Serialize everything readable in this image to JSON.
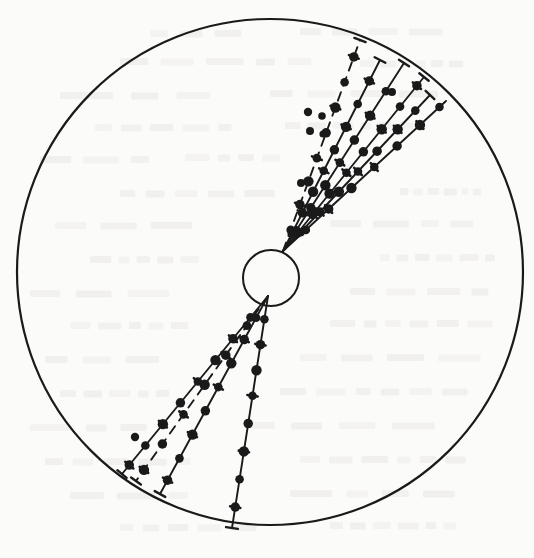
{
  "figure": {
    "kind": "track-chamber-event-display",
    "caption": "",
    "background_color": "#fbfbfa",
    "ink_color": "#1a1a1a",
    "ghost_text_color": "#c9c7c2"
  },
  "detector_boundary": {
    "label": "outer detector circle",
    "center_x": 270,
    "center_y": 272,
    "radius": 253,
    "stroke_width": 2.2
  },
  "vertex_circle": {
    "label": "interaction vertex circle",
    "center_x": 271,
    "center_y": 278,
    "radius": 28,
    "stroke_width": 2.0
  },
  "vertex": {
    "label": "primary vertex",
    "x": 278,
    "y": 258
  },
  "chart_data": {
    "type": "scatter",
    "title": "",
    "xlabel": "",
    "ylabel": "",
    "xlim": [
      17,
      523
    ],
    "ylim": [
      19,
      525
    ],
    "grid": false,
    "legend": "none",
    "tracks": [
      {
        "name": "upper-track-1",
        "style": "dashed",
        "x1": 283,
        "y1": 251,
        "x2": 360,
        "y2": 40,
        "points_t": [
          0.1,
          0.22,
          0.33,
          0.44,
          0.56,
          0.68,
          0.8,
          0.92
        ],
        "end_tick": true
      },
      {
        "name": "upper-track-2",
        "style": "solid",
        "x1": 283,
        "y1": 251,
        "x2": 380,
        "y2": 60,
        "points_t": [
          0.09,
          0.2,
          0.31,
          0.42,
          0.53,
          0.65,
          0.77,
          0.89
        ],
        "end_tick": true
      },
      {
        "name": "upper-track-3",
        "style": "solid",
        "x1": 283,
        "y1": 251,
        "x2": 404,
        "y2": 63,
        "points_t": [
          0.11,
          0.23,
          0.35,
          0.47,
          0.59,
          0.72,
          0.85
        ],
        "end_tick": true
      },
      {
        "name": "upper-track-4",
        "style": "solid",
        "x1": 283,
        "y1": 251,
        "x2": 424,
        "y2": 77,
        "points_t": [
          0.1,
          0.21,
          0.33,
          0.45,
          0.57,
          0.7,
          0.83,
          0.95
        ],
        "end_tick": true
      },
      {
        "name": "upper-track-5",
        "style": "solid",
        "x1": 283,
        "y1": 251,
        "x2": 430,
        "y2": 95,
        "points_t": [
          0.12,
          0.25,
          0.38,
          0.51,
          0.64,
          0.78,
          0.9
        ],
        "end_tick": true
      },
      {
        "name": "upper-track-6",
        "style": "solid",
        "x1": 283,
        "y1": 251,
        "x2": 446,
        "y2": 101,
        "points_t": [
          0.14,
          0.28,
          0.42,
          0.56,
          0.7,
          0.84,
          0.96
        ],
        "end_tick": false
      },
      {
        "name": "lower-track-1",
        "style": "solid",
        "x1": 268,
        "y1": 296,
        "x2": 122,
        "y2": 474,
        "points_t": [
          0.12,
          0.24,
          0.36,
          0.48,
          0.6,
          0.72,
          0.84,
          0.95
        ],
        "end_tick": true
      },
      {
        "name": "lower-track-2",
        "style": "dashed",
        "x1": 268,
        "y1": 296,
        "x2": 136,
        "y2": 481,
        "points_t": [
          0.16,
          0.32,
          0.48,
          0.64,
          0.8,
          0.94
        ],
        "end_tick": true
      },
      {
        "name": "lower-track-3",
        "style": "solid",
        "x1": 268,
        "y1": 296,
        "x2": 160,
        "y2": 494,
        "points_t": [
          0.11,
          0.22,
          0.34,
          0.46,
          0.58,
          0.7,
          0.82,
          0.93
        ],
        "end_tick": true
      },
      {
        "name": "lower-track-4",
        "style": "solid",
        "x1": 268,
        "y1": 296,
        "x2": 232,
        "y2": 528,
        "points_t": [
          0.1,
          0.21,
          0.32,
          0.43,
          0.55,
          0.67,
          0.79,
          0.91
        ],
        "end_tick": true
      }
    ],
    "isolated_marks": [
      {
        "name": "stray-dot-a",
        "x": 308,
        "y": 112,
        "r": 4.2
      },
      {
        "name": "stray-dot-b",
        "x": 322,
        "y": 116,
        "r": 3.8
      },
      {
        "name": "stray-dot-c",
        "x": 310,
        "y": 131,
        "r": 4.0
      },
      {
        "name": "stray-dot-d",
        "x": 323,
        "y": 134,
        "r": 3.6
      },
      {
        "name": "stray-dash-e",
        "x": 301,
        "y": 183,
        "r": 4.0
      },
      {
        "name": "stray-dot-f",
        "x": 392,
        "y": 92,
        "r": 4.0
      },
      {
        "name": "stray-dot-g",
        "x": 135,
        "y": 437,
        "r": 4.2
      }
    ]
  },
  "ghost_text": {
    "note": "faint show-through text from reverse of scanned page, illegible",
    "lines": [
      {
        "x": 150,
        "y": 30,
        "w": 120,
        "h": 7
      },
      {
        "x": 300,
        "y": 28,
        "w": 150,
        "h": 7
      },
      {
        "x": 120,
        "y": 58,
        "w": 210,
        "h": 7
      },
      {
        "x": 360,
        "y": 60,
        "w": 110,
        "h": 7
      },
      {
        "x": 60,
        "y": 92,
        "w": 180,
        "h": 7
      },
      {
        "x": 270,
        "y": 90,
        "w": 200,
        "h": 7
      },
      {
        "x": 95,
        "y": 124,
        "w": 150,
        "h": 7
      },
      {
        "x": 285,
        "y": 122,
        "w": 140,
        "h": 7
      },
      {
        "x": 40,
        "y": 156,
        "w": 120,
        "h": 7
      },
      {
        "x": 185,
        "y": 154,
        "w": 110,
        "h": 7
      },
      {
        "x": 120,
        "y": 190,
        "w": 170,
        "h": 7
      },
      {
        "x": 400,
        "y": 188,
        "w": 90,
        "h": 7
      },
      {
        "x": 55,
        "y": 222,
        "w": 140,
        "h": 7
      },
      {
        "x": 330,
        "y": 220,
        "w": 160,
        "h": 7
      },
      {
        "x": 90,
        "y": 256,
        "w": 120,
        "h": 7
      },
      {
        "x": 380,
        "y": 254,
        "w": 130,
        "h": 7
      },
      {
        "x": 30,
        "y": 290,
        "w": 160,
        "h": 7
      },
      {
        "x": 350,
        "y": 288,
        "w": 150,
        "h": 7
      },
      {
        "x": 70,
        "y": 322,
        "w": 130,
        "h": 7
      },
      {
        "x": 330,
        "y": 320,
        "w": 170,
        "h": 7
      },
      {
        "x": 45,
        "y": 356,
        "w": 150,
        "h": 7
      },
      {
        "x": 300,
        "y": 354,
        "w": 190,
        "h": 7
      },
      {
        "x": 60,
        "y": 390,
        "w": 120,
        "h": 7
      },
      {
        "x": 280,
        "y": 388,
        "w": 200,
        "h": 7
      },
      {
        "x": 30,
        "y": 424,
        "w": 140,
        "h": 7
      },
      {
        "x": 250,
        "y": 422,
        "w": 220,
        "h": 7
      },
      {
        "x": 45,
        "y": 458,
        "w": 160,
        "h": 7
      },
      {
        "x": 300,
        "y": 456,
        "w": 180,
        "h": 7
      },
      {
        "x": 70,
        "y": 492,
        "w": 130,
        "h": 7
      },
      {
        "x": 290,
        "y": 490,
        "w": 190,
        "h": 7
      },
      {
        "x": 120,
        "y": 524,
        "w": 150,
        "h": 7
      },
      {
        "x": 330,
        "y": 522,
        "w": 140,
        "h": 7
      }
    ]
  }
}
